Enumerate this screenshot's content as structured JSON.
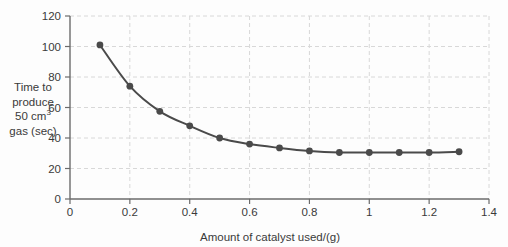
{
  "chart_data": {
    "type": "line",
    "title": "",
    "xlabel": "Amount of catalyst used/(g)",
    "ylabel_lines": [
      "Time to",
      "produce",
      "50 cm",
      "gas (sec)"
    ],
    "ylabel_superscript": "3",
    "ylabel_full": "Time to produce 50 cm3 gas (sec)",
    "x": [
      0.1,
      0.2,
      0.3,
      0.4,
      0.5,
      0.6,
      0.7,
      0.8,
      0.9,
      1.0,
      1.1,
      1.2,
      1.3
    ],
    "values": [
      101,
      74,
      57.5,
      48,
      40,
      36,
      33.5,
      31.5,
      30.5,
      30.5,
      30.5,
      30.5,
      31
    ],
    "xlim": [
      0,
      1.4
    ],
    "ylim": [
      0,
      120
    ],
    "xticks": [
      0,
      0.2,
      0.4,
      0.6,
      0.8,
      1.0,
      1.2,
      1.4
    ],
    "xtick_labels": [
      "0",
      "0.2",
      "0.4",
      "0.6",
      "0.8",
      "1",
      "1.2",
      "1.4"
    ],
    "yticks": [
      0,
      20,
      40,
      60,
      80,
      100,
      120
    ],
    "ytick_labels": [
      "0",
      "20",
      "40",
      "60",
      "80",
      "100",
      "120"
    ],
    "grid": true,
    "grid_color": "#d8d8d8",
    "legend": null,
    "line_color": "#4a4a4a",
    "marker_color": "#4a4a4a",
    "marker": "circle",
    "axis_color": "#6b6b6b",
    "background_color": "#fdfdfd"
  }
}
